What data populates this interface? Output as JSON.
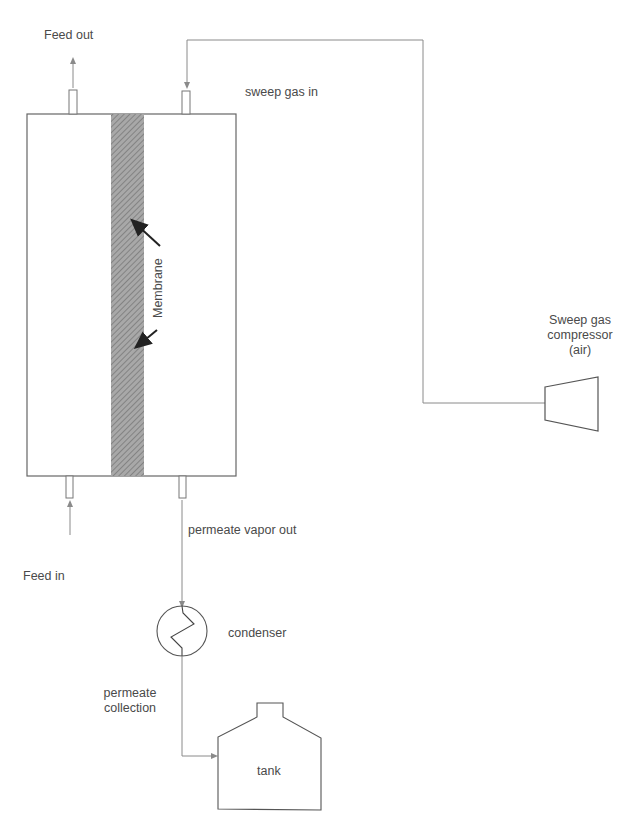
{
  "diagram": {
    "type": "process-flow",
    "title": "",
    "labels": {
      "feed_out": "Feed out",
      "sweep_gas_in": "sweep gas in",
      "membrane": "Membrane",
      "compressor_line1": "Sweep gas",
      "compressor_line2": "compressor",
      "compressor_line3": "(air)",
      "feed_in": "Feed in",
      "permeate_vapor_out": "permeate vapor out",
      "condenser": "condenser",
      "permeate_collection_line1": "permeate",
      "permeate_collection_line2": "collection",
      "tank": "tank"
    },
    "nodes": [
      {
        "id": "membrane-module",
        "label": "Membrane module"
      },
      {
        "id": "membrane",
        "label": "Membrane"
      },
      {
        "id": "sweep-gas-compressor",
        "label": "Sweep gas compressor (air)"
      },
      {
        "id": "condenser",
        "label": "condenser"
      },
      {
        "id": "tank",
        "label": "tank"
      }
    ],
    "edges": [
      {
        "from": "external",
        "to": "membrane-module",
        "label": "Feed in"
      },
      {
        "from": "membrane-module",
        "to": "external",
        "label": "Feed out"
      },
      {
        "from": "sweep-gas-compressor",
        "to": "membrane-module",
        "label": "sweep gas in"
      },
      {
        "from": "membrane-module",
        "to": "condenser",
        "label": "permeate vapor out"
      },
      {
        "from": "condenser",
        "to": "tank",
        "label": "permeate collection"
      }
    ],
    "colors": {
      "line": "#8a8a8a",
      "outline": "#555555",
      "membrane_fill": "#9a9a9a",
      "arrow": "#222222"
    }
  }
}
